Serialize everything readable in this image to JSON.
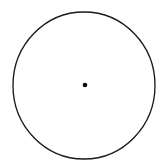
{
  "figure": {
    "title": "Circle with marked center",
    "canvas": {
      "width": 165,
      "height": 167,
      "background_color": "#ffffff"
    },
    "shapes": {
      "circle": {
        "label": "circle outline",
        "center_x": 84,
        "center_y": 85.5,
        "radius_x": 71,
        "radius_y": 73.5,
        "stroke_color": "#1b1b1b",
        "stroke_width": 1.35,
        "fill": "none"
      },
      "center_point": {
        "label": "center point",
        "center_x": 85,
        "center_y": 85,
        "radius": 2.3,
        "fill_color": "#0b0b0b"
      }
    }
  }
}
